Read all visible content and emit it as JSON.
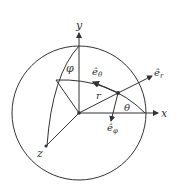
{
  "diagram": {
    "labels": {
      "y_axis": "y",
      "x_axis": "x",
      "z_axis": "z",
      "phi": "φ",
      "theta": "θ",
      "r": "r",
      "e_r": "ê",
      "e_r_sub": "r",
      "e_theta": "ê",
      "e_theta_sub": "θ",
      "e_phi": "ê",
      "e_phi_sub": "φ"
    },
    "colors": {
      "stroke": "#333333",
      "background": "#ffffff"
    }
  }
}
